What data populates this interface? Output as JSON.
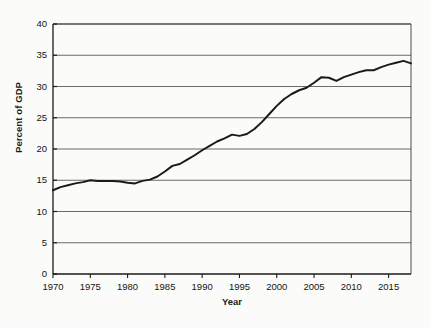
{
  "chart_data": {
    "type": "line",
    "title": "",
    "xlabel": "Year",
    "ylabel": "Percent of GDP",
    "xlim": [
      1970,
      2018
    ],
    "ylim": [
      0,
      40
    ],
    "grid": true,
    "legend": "none",
    "x_ticks": [
      "1970",
      "1975",
      "1980",
      "1985",
      "1990",
      "1995",
      "2000",
      "2005",
      "2010",
      "2015"
    ],
    "x_tick_values": [
      1970,
      1975,
      1980,
      1985,
      1990,
      1995,
      2000,
      2005,
      2010,
      2015
    ],
    "y_ticks": [
      "0",
      "5",
      "10",
      "15",
      "20",
      "25",
      "30",
      "35",
      "40"
    ],
    "y_tick_values": [
      0,
      5,
      10,
      15,
      20,
      25,
      30,
      35,
      40
    ],
    "series": [
      {
        "name": "Percent of GDP",
        "color": "#1a1a1a",
        "x": [
          1970,
          1971,
          1972,
          1973,
          1974,
          1975,
          1976,
          1977,
          1978,
          1979,
          1980,
          1981,
          1982,
          1983,
          1984,
          1985,
          1986,
          1987,
          1988,
          1989,
          1990,
          1991,
          1992,
          1993,
          1994,
          1995,
          1996,
          1997,
          1998,
          1999,
          2000,
          2001,
          2002,
          2003,
          2004,
          2005,
          2006,
          2007,
          2008,
          2009,
          2010,
          2011,
          2012,
          2013,
          2014,
          2015,
          2016,
          2017,
          2018
        ],
        "values": [
          13.4,
          13.9,
          14.2,
          14.5,
          14.7,
          15.0,
          14.9,
          14.9,
          14.9,
          14.8,
          14.6,
          14.5,
          14.9,
          15.1,
          15.6,
          16.4,
          17.3,
          17.6,
          18.3,
          19.0,
          19.8,
          20.5,
          21.2,
          21.7,
          22.3,
          22.1,
          22.4,
          23.2,
          24.3,
          25.6,
          26.9,
          28.0,
          28.8,
          29.4,
          29.8,
          30.6,
          31.5,
          31.4,
          30.9,
          31.5,
          31.9,
          32.3,
          32.6,
          32.6,
          33.1,
          33.5,
          33.8,
          34.1,
          33.7
        ]
      }
    ]
  },
  "axes": {
    "y_axis_title": "Percent of GDP",
    "x_axis_title": "Year"
  }
}
